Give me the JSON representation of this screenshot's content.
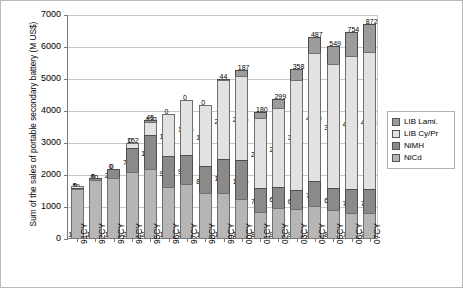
{
  "chart_data": {
    "type": "bar",
    "stacked": true,
    "title": "",
    "xlabel": "",
    "ylabel": "Sum of the sales of portable secondary battery (M US$)",
    "ylim": [
      0,
      7000
    ],
    "ytick_labels": [
      "0",
      "1000",
      "2000",
      "3000",
      "4000",
      "5000",
      "6000",
      "7000"
    ],
    "ytick_values": [
      0,
      1000,
      2000,
      3000,
      4000,
      5000,
      6000,
      7000
    ],
    "grid": true,
    "legend_position": "right",
    "categories": [
      "91CY",
      "92CY",
      "93CY",
      "94CY",
      "95CY",
      "96CY",
      "97CY",
      "98CY",
      "99CY",
      "00CY",
      "01CY",
      "02CY",
      "03CY",
      "04CY",
      "05CY",
      "06CY",
      "07CY"
    ],
    "series": [
      {
        "name": "NiCd",
        "values": [
          1535,
          1823,
          1883,
          2060,
          2171,
          1595,
          1692,
          1394,
          1399,
          1204,
          810,
          935,
          905,
          1006,
          873,
          781,
          779
        ]
      },
      {
        "name": "NiMH",
        "values": [
          39,
          10,
          261,
          746,
          1038,
          983,
          910,
          848,
          1071,
          1245,
          767,
          667,
          600,
          767,
          692,
          739,
          750
        ]
      },
      {
        "name": "LIB Cy/Pr",
        "values": [
          1,
          0,
          0,
          152,
          422,
          1292,
          1715,
          1900,
          2458,
          2605,
          2189,
          2458,
          3427,
          4019,
          3878,
          4169,
          4273
        ]
      },
      {
        "name": "LIB Lami.",
        "values": [
          0,
          0,
          0,
          0,
          45,
          0,
          0,
          0,
          44,
          187,
          180,
          299,
          358,
          487,
          549,
          754,
          872
        ]
      }
    ]
  },
  "legend": {
    "items": [
      {
        "label": "LIB Lami.",
        "color": "#9c9c9c"
      },
      {
        "label": "LIB Cy/Pr",
        "color": "#e2e2e2"
      },
      {
        "label": "NiMH",
        "color": "#8a8a8a"
      },
      {
        "label": "NiCd",
        "color": "#b6b6b6"
      }
    ]
  }
}
